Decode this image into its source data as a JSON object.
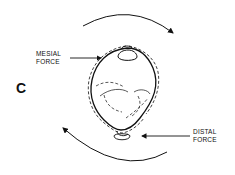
{
  "panel_label": "C",
  "labels": {
    "mesial_line1": "MESIAL",
    "mesial_line2": "FORCE",
    "distal_line1": "DISTAL",
    "distal_line2": "FORCE"
  },
  "icons": {
    "rotation_top": "clockwise-arc-arrow",
    "rotation_bottom": "clockwise-arc-arrow",
    "tooth": "tooth-occlusal-outline"
  }
}
